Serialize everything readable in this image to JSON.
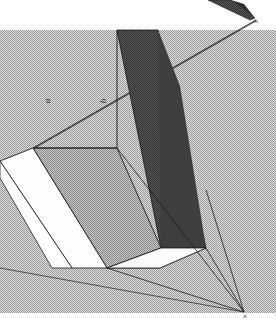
{
  "figure": {
    "type": "perspective-line-drawing",
    "canvas": {
      "width": 276,
      "height": 329
    },
    "background_color": "#ffffff",
    "panel": {
      "name": "halftone-ground-panel",
      "x": 0,
      "y": 30,
      "width": 276,
      "height": 283,
      "fill_color": "#c9c9c9",
      "texture": "halftone-dither"
    },
    "labels": {
      "edge_a": "a",
      "edge_b": "b",
      "vanishing_point_top": "×",
      "vanishing_point_bottom": "×",
      "vanishing_point_top_label": "x",
      "vanishing_point_bottom_label": "x"
    },
    "vanishing_points": [
      {
        "name": "vanishing-point-upper-right",
        "x": 256,
        "y": 21,
        "marker": "×"
      },
      {
        "name": "vanishing-point-lower-right",
        "x": 244,
        "y": 313,
        "marker": "×"
      }
    ],
    "label_positions": {
      "a": {
        "x": 48,
        "y": 101,
        "rotation": -90
      },
      "b": {
        "x": 104,
        "y": 101,
        "rotation": -90
      }
    },
    "colors": {
      "face_dark_right": "#4b4b4b",
      "face_mid_top": "#b0b0b0",
      "face_light_gray": "#d4d4d4",
      "face_white": "#fdfdfd",
      "line_stroke": "#1e1e1e",
      "ground_halftone": "#c9c9c9",
      "wedge_dark": "#3a3a3a"
    },
    "faces": [
      {
        "name": "upper-dark-wedge",
        "fill": "#3a3a3a",
        "points": "232,0 214,0 252,16 256,19"
      },
      {
        "name": "tall-dark-right-face",
        "fill": "#4b4b4b",
        "points": "116,30 158,30 205,247 161,247"
      },
      {
        "name": "dark-face-lower-return",
        "fill": "#4b4b4b",
        "points": "158,30 205,247 205,190 180,74"
      },
      {
        "name": "top-face-mid-gray",
        "fill": "#b2b2b2",
        "points": "33,148 116,148 161,247 107,268"
      },
      {
        "name": "front-face-white-left",
        "fill": "#fdfdfd",
        "points": "0,160 33,148 107,268 72,268"
      },
      {
        "name": "bottom-face-white-right",
        "fill": "#fbfbfb",
        "points": "107,268 161,247 205,247 160,268"
      },
      {
        "name": "bottom-face-white-wedge",
        "fill": "#fdfdfd",
        "points": "72,268 107,268 160,268 119,268"
      }
    ],
    "construction_lines": [
      {
        "name": "line-to-upper-vp-a",
        "x1": 33,
        "y1": 148,
        "x2": 256,
        "y2": 21
      },
      {
        "name": "line-to-upper-vp-b",
        "x1": 33,
        "y1": 148,
        "x2": 256,
        "y2": 21
      },
      {
        "name": "line-to-lower-vp-1",
        "x1": 116,
        "y1": 148,
        "x2": 244,
        "y2": 313
      },
      {
        "name": "line-to-lower-vp-2",
        "x1": 161,
        "y1": 247,
        "x2": 244,
        "y2": 313
      },
      {
        "name": "line-to-lower-vp-3",
        "x1": 205,
        "y1": 190,
        "x2": 244,
        "y2": 313
      },
      {
        "name": "line-to-lower-vp-4",
        "x1": 107,
        "y1": 268,
        "x2": 244,
        "y2": 313
      }
    ]
  }
}
